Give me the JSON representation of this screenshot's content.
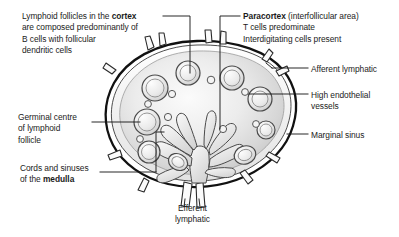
{
  "figure": {
    "background_color": "#ffffff",
    "ink_color": "#1b1b1b",
    "node_fill_light": "#f2f2f2",
    "node_fill_mid": "#d8d8d8",
    "node_fill_dark": "#b9b9b9",
    "capsule_color": "#111111"
  },
  "labels": {
    "cortex": {
      "line1_a": "Lymphoid follicles in the ",
      "line1_b": "cortex",
      "line2": "are composed predominantly of",
      "line3": "B cells with follicular",
      "line4": "dendritic cells"
    },
    "paracortex": {
      "line1_a": "Paracortex",
      "line1_b": " (interfollicular area)",
      "line2": "T cells predominate",
      "line3": "Interdigitating cells present"
    },
    "afferent": {
      "line1": "Afferent lymphatic"
    },
    "high_endothelial_vessels": {
      "line1": "High endothelial",
      "line2": "vessels"
    },
    "marginal_sinus": {
      "line1": "Marginal sinus"
    },
    "germinal_centre": {
      "line1": "Germinal centre",
      "line2": "of lymphoid",
      "line3": "follicle"
    },
    "cords_and_sinuses": {
      "line1": "Cords and sinuses",
      "line2_a": "of the ",
      "line2_b": "medulla"
    },
    "efferent": {
      "line1": "Efferent",
      "line2": "lymphatic"
    }
  },
  "diagram": {
    "structures": [
      "lymph-node-capsule",
      "cortex-region",
      "paracortex-region",
      "medulla-region",
      "lymphoid-follicles",
      "germinal-centres",
      "high-endothelial-venules",
      "afferent-lymphatic-vessels",
      "efferent-lymphatic-vessel",
      "marginal-sinus",
      "medullary-cords-and-sinuses"
    ],
    "follicle_count": 9,
    "small_vessel_count": 7,
    "afferent_vessel_count": 6,
    "efferent_vessel_count": 1
  }
}
